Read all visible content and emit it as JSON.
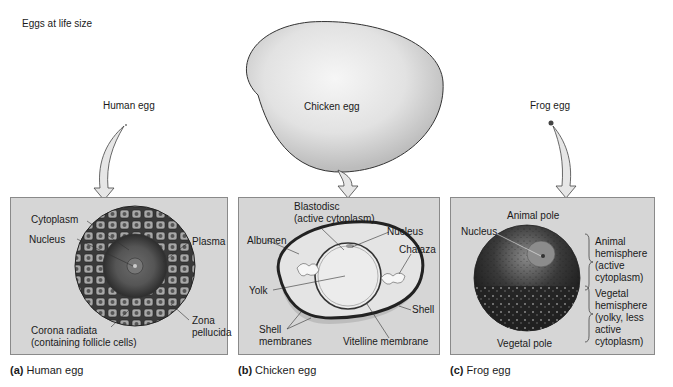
{
  "title": "Eggs at life size",
  "top_labels": {
    "human": "Human egg",
    "chicken": "Chicken egg",
    "frog": "Frog egg"
  },
  "panels": {
    "a": {
      "letter": "(a)",
      "caption": "Human egg",
      "labels": {
        "cytoplasm": "Cytoplasm",
        "nucleus": "Nucleus",
        "plasma": "Plasma",
        "zona1": "Zona",
        "zona2": "pellucida",
        "corona1": "Corona radiata",
        "corona2": "(containing follicle cells)"
      }
    },
    "b": {
      "letter": "(b)",
      "caption": "Chicken egg",
      "labels": {
        "blastodisc1": "Blastodisc",
        "blastodisc2": "(active cytoplasm)",
        "nucleus": "Nucleus",
        "albumen": "Albumen",
        "chalaza": "Chalaza",
        "yolk": "Yolk",
        "shell": "Shell",
        "shellmem1": "Shell",
        "shellmem2": "membranes",
        "vitelline": "Vitelline membrane"
      }
    },
    "c": {
      "letter": "(c)",
      "caption": "Frog egg",
      "labels": {
        "animal_pole": "Animal pole",
        "nucleus": "Nucleus",
        "animal_hemi": [
          "Animal",
          "hemisphere",
          "(active",
          "cytoplasm)"
        ],
        "vegetal_hemi": [
          "Vegetal",
          "hemisphere",
          "(yolky, less",
          "active",
          "cytoplasm)"
        ],
        "vegetal_pole": "Vegetal pole"
      }
    }
  },
  "colors": {
    "panel_bg": "#d6d6d6",
    "panel_border": "#8a8a8a",
    "egg_dark": "#2a2a2a",
    "arrow_fill": "#e6e6e6"
  }
}
